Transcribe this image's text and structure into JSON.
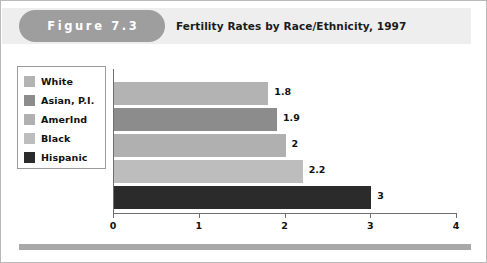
{
  "figure": {
    "label": "Figure 7.3",
    "title": "Fertility Rates by Race/Ethnicity, 1997",
    "header_bg": "#eeeeee",
    "pill_bg": "#9e9e9e",
    "border_color": "#b9b9b9",
    "footer_rule_color": "#a8a8a8"
  },
  "legend": {
    "border_color": "#9a9a9a",
    "items": [
      {
        "label": "White",
        "color": "#b3b3b3"
      },
      {
        "label": "Asian, P.I.",
        "color": "#8c8c8c"
      },
      {
        "label": "AmerInd",
        "color": "#b0b0b0"
      },
      {
        "label": "Black",
        "color": "#bdbdbd"
      },
      {
        "label": "Hispanic",
        "color": "#2b2b2b"
      }
    ]
  },
  "axis": {
    "color": "#6f6f6f",
    "ticks": [
      "0",
      "1",
      "2",
      "3",
      "4"
    ]
  },
  "chart_data": {
    "type": "bar",
    "orientation": "horizontal",
    "title": "Fertility Rates by Race/Ethnicity, 1997",
    "xlabel": "",
    "ylabel": "",
    "xlim": [
      0,
      4
    ],
    "xticks": [
      0,
      1,
      2,
      3,
      4
    ],
    "grid": false,
    "legend_position": "left",
    "categories": [
      "White",
      "Asian, P.I.",
      "AmerInd",
      "Black",
      "Hispanic"
    ],
    "values": [
      1.8,
      1.9,
      2,
      2.2,
      3
    ],
    "value_labels": [
      "1.8",
      "1.9",
      "2",
      "2.2",
      "3"
    ],
    "colors": [
      "#b3b3b3",
      "#8c8c8c",
      "#b0b0b0",
      "#bdbdbd",
      "#2b2b2b"
    ]
  }
}
